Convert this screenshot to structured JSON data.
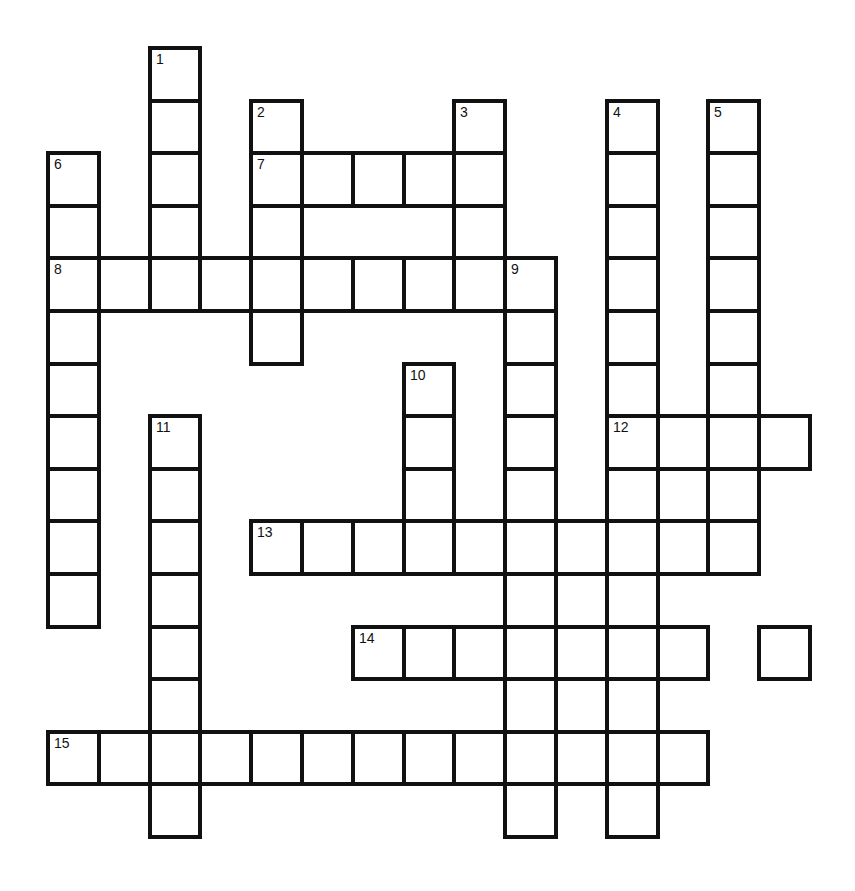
{
  "puzzle": {
    "type": "crossword",
    "grid": {
      "origin_x": 48,
      "origin_y": 48,
      "cell_w": 50.8,
      "cell_h": 52.6,
      "line_color": "#111111",
      "fill_color": "#ffffff"
    },
    "cells": [
      [
        0,
        2,
        "1"
      ],
      [
        1,
        2,
        ""
      ],
      [
        2,
        2,
        ""
      ],
      [
        3,
        2,
        ""
      ],
      [
        4,
        2,
        ""
      ],
      [
        1,
        4,
        "2"
      ],
      [
        2,
        4,
        "7"
      ],
      [
        3,
        4,
        ""
      ],
      [
        4,
        4,
        ""
      ],
      [
        5,
        4,
        ""
      ],
      [
        1,
        8,
        "3"
      ],
      [
        2,
        8,
        ""
      ],
      [
        3,
        8,
        ""
      ],
      [
        4,
        8,
        ""
      ],
      [
        1,
        11,
        "4"
      ],
      [
        2,
        11,
        ""
      ],
      [
        3,
        11,
        ""
      ],
      [
        4,
        11,
        ""
      ],
      [
        5,
        11,
        ""
      ],
      [
        6,
        11,
        ""
      ],
      [
        7,
        11,
        "12"
      ],
      [
        8,
        11,
        ""
      ],
      [
        9,
        11,
        ""
      ],
      [
        10,
        11,
        ""
      ],
      [
        11,
        11,
        ""
      ],
      [
        12,
        11,
        ""
      ],
      [
        13,
        11,
        ""
      ],
      [
        14,
        11,
        ""
      ],
      [
        1,
        13,
        "5"
      ],
      [
        2,
        13,
        ""
      ],
      [
        3,
        13,
        ""
      ],
      [
        4,
        13,
        ""
      ],
      [
        5,
        13,
        ""
      ],
      [
        6,
        13,
        ""
      ],
      [
        7,
        13,
        ""
      ],
      [
        8,
        13,
        ""
      ],
      [
        9,
        13,
        ""
      ],
      [
        2,
        0,
        "6"
      ],
      [
        3,
        0,
        ""
      ],
      [
        4,
        0,
        "8"
      ],
      [
        5,
        0,
        ""
      ],
      [
        6,
        0,
        ""
      ],
      [
        7,
        0,
        ""
      ],
      [
        8,
        0,
        ""
      ],
      [
        9,
        0,
        ""
      ],
      [
        10,
        0,
        ""
      ],
      [
        2,
        5,
        ""
      ],
      [
        2,
        6,
        ""
      ],
      [
        2,
        7,
        ""
      ],
      [
        4,
        1,
        ""
      ],
      [
        4,
        3,
        ""
      ],
      [
        4,
        5,
        ""
      ],
      [
        4,
        6,
        ""
      ],
      [
        4,
        7,
        ""
      ],
      [
        4,
        9,
        "9"
      ],
      [
        5,
        9,
        ""
      ],
      [
        6,
        9,
        ""
      ],
      [
        7,
        9,
        ""
      ],
      [
        8,
        9,
        ""
      ],
      [
        9,
        9,
        ""
      ],
      [
        10,
        9,
        ""
      ],
      [
        11,
        9,
        ""
      ],
      [
        12,
        9,
        ""
      ],
      [
        13,
        9,
        ""
      ],
      [
        14,
        9,
        ""
      ],
      [
        6,
        7,
        "10"
      ],
      [
        7,
        7,
        ""
      ],
      [
        8,
        7,
        ""
      ],
      [
        9,
        7,
        ""
      ],
      [
        7,
        2,
        "11"
      ],
      [
        8,
        2,
        ""
      ],
      [
        9,
        2,
        ""
      ],
      [
        10,
        2,
        ""
      ],
      [
        11,
        2,
        ""
      ],
      [
        12,
        2,
        ""
      ],
      [
        13,
        2,
        ""
      ],
      [
        14,
        2,
        ""
      ],
      [
        7,
        12,
        ""
      ],
      [
        7,
        14,
        ""
      ],
      [
        8,
        12,
        ""
      ],
      [
        9,
        4,
        "13"
      ],
      [
        9,
        5,
        ""
      ],
      [
        9,
        6,
        ""
      ],
      [
        9,
        8,
        ""
      ],
      [
        9,
        10,
        ""
      ],
      [
        9,
        12,
        ""
      ],
      [
        10,
        10,
        ""
      ],
      [
        11,
        10,
        ""
      ],
      [
        12,
        10,
        ""
      ],
      [
        11,
        6,
        "14"
      ],
      [
        11,
        7,
        ""
      ],
      [
        11,
        8,
        ""
      ],
      [
        11,
        12,
        ""
      ],
      [
        11,
        14,
        ""
      ],
      [
        13,
        0,
        "15"
      ],
      [
        13,
        1,
        ""
      ],
      [
        13,
        3,
        ""
      ],
      [
        13,
        4,
        ""
      ],
      [
        13,
        5,
        ""
      ],
      [
        13,
        6,
        ""
      ],
      [
        13,
        7,
        ""
      ],
      [
        13,
        8,
        ""
      ],
      [
        13,
        10,
        ""
      ],
      [
        13,
        12,
        ""
      ]
    ],
    "clue_numbers": {
      "across": [
        "7",
        "8",
        "12",
        "13",
        "14",
        "15"
      ],
      "down": [
        "1",
        "2",
        "3",
        "4",
        "5",
        "6",
        "9",
        "10",
        "11"
      ]
    }
  }
}
